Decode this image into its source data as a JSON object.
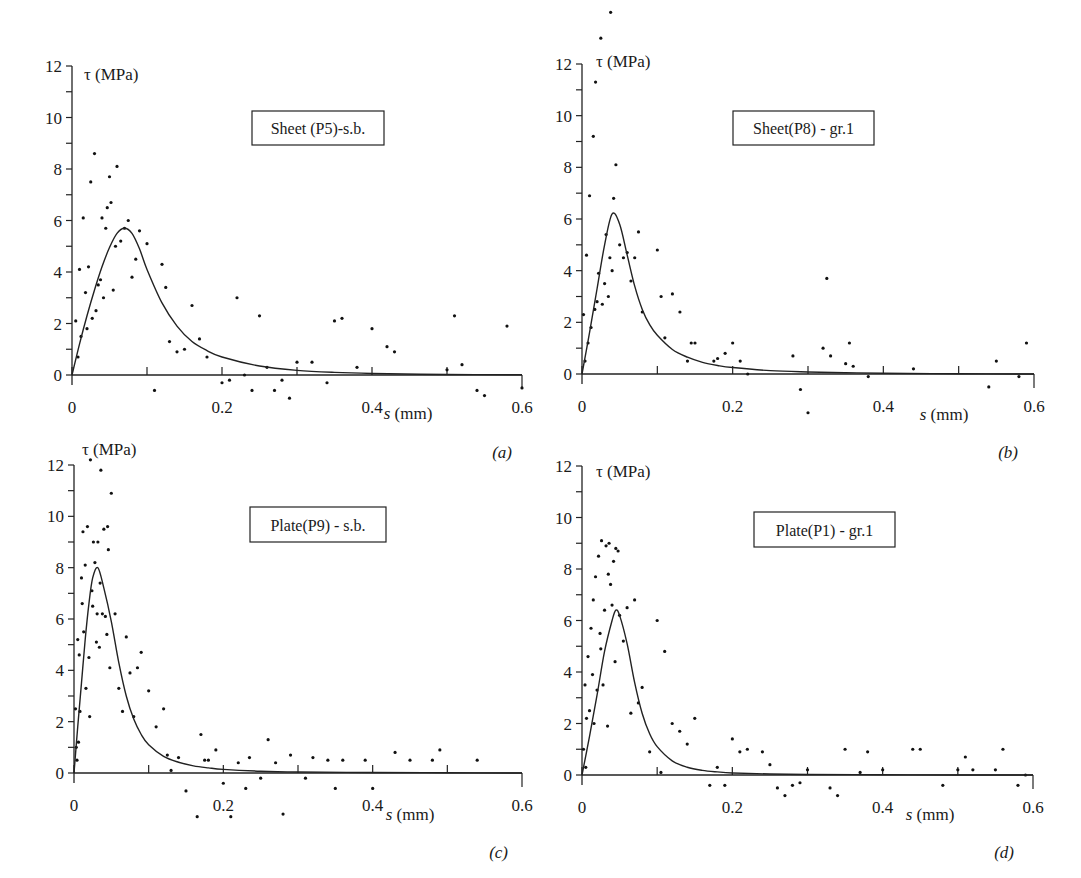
{
  "figure": {
    "panel_tags": [
      "(a)",
      "(b)",
      "(c)",
      "(d)"
    ]
  },
  "chart_data": [
    {
      "type": "scatter",
      "panel": "(a)",
      "title": "Sheet (P5)-s.b.",
      "xlabel": "s (mm)",
      "ylabel": "τ (MPa)",
      "xlim": [
        0,
        0.6
      ],
      "ylim": [
        0,
        12
      ],
      "xticks": [
        "0",
        "0.2",
        "0.4",
        "0.6"
      ],
      "yticks": [
        "0",
        "2",
        "4",
        "6",
        "8",
        "10",
        "12"
      ],
      "grid": false,
      "legend_position": "upper-center (boxed label)",
      "fit_curve": {
        "name": "bond-slip fit",
        "peak_s": 0.07,
        "peak_tau": 5.7,
        "x": [
          0,
          0.01,
          0.02,
          0.03,
          0.04,
          0.05,
          0.06,
          0.07,
          0.08,
          0.09,
          0.1,
          0.12,
          0.14,
          0.16,
          0.18,
          0.2,
          0.25,
          0.3,
          0.35,
          0.4,
          0.5,
          0.6
        ],
        "y": [
          0,
          1.2,
          2.3,
          3.3,
          4.2,
          4.95,
          5.5,
          5.7,
          5.5,
          4.9,
          4.1,
          2.8,
          1.9,
          1.3,
          0.95,
          0.7,
          0.35,
          0.18,
          0.1,
          0.06,
          0.02,
          0.01
        ]
      },
      "points": {
        "x": [
          0.005,
          0.008,
          0.01,
          0.012,
          0.015,
          0.018,
          0.02,
          0.022,
          0.025,
          0.027,
          0.03,
          0.032,
          0.035,
          0.038,
          0.04,
          0.042,
          0.045,
          0.047,
          0.05,
          0.052,
          0.055,
          0.058,
          0.06,
          0.065,
          0.07,
          0.075,
          0.08,
          0.085,
          0.09,
          0.1,
          0.11,
          0.12,
          0.125,
          0.13,
          0.14,
          0.15,
          0.16,
          0.17,
          0.18,
          0.2,
          0.21,
          0.22,
          0.23,
          0.24,
          0.25,
          0.26,
          0.27,
          0.28,
          0.29,
          0.3,
          0.32,
          0.34,
          0.35,
          0.36,
          0.38,
          0.4,
          0.42,
          0.43,
          0.5,
          0.51,
          0.52,
          0.54,
          0.55,
          0.58,
          0.6
        ],
        "y": [
          2.1,
          0.7,
          4.1,
          1.5,
          6.1,
          3.2,
          1.8,
          4.2,
          7.5,
          2.2,
          8.6,
          2.5,
          3.5,
          3.7,
          6.1,
          3.0,
          5.7,
          6.5,
          7.7,
          6.7,
          3.3,
          5.0,
          8.1,
          5.2,
          5.7,
          6.0,
          3.8,
          4.5,
          5.6,
          5.1,
          -0.6,
          4.3,
          3.4,
          1.3,
          0.9,
          1.0,
          2.7,
          1.4,
          0.7,
          -0.3,
          -0.2,
          3.0,
          0.0,
          -0.6,
          2.3,
          0.3,
          -0.6,
          -0.2,
          -0.9,
          0.5,
          0.5,
          -0.3,
          2.1,
          2.2,
          0.3,
          1.8,
          1.1,
          0.9,
          0.2,
          2.3,
          0.4,
          -0.6,
          -0.8,
          1.9,
          -0.5
        ]
      }
    },
    {
      "type": "scatter",
      "panel": "(b)",
      "title": "Sheet(P8) - gr.1",
      "xlabel": "s (mm)",
      "ylabel": "τ (MPa)",
      "xlim": [
        0,
        0.6
      ],
      "ylim": [
        0,
        12
      ],
      "xticks": [
        "0",
        "0.2",
        "0.4",
        "0.6"
      ],
      "yticks": [
        "0",
        "2",
        "4",
        "6",
        "8",
        "10",
        "12"
      ],
      "grid": false,
      "legend_position": "upper-center (boxed label)",
      "fit_curve": {
        "name": "bond-slip fit",
        "peak_s": 0.04,
        "peak_tau": 6.2,
        "x": [
          0,
          0.01,
          0.02,
          0.03,
          0.04,
          0.05,
          0.06,
          0.07,
          0.08,
          0.09,
          0.1,
          0.12,
          0.14,
          0.16,
          0.18,
          0.2,
          0.25,
          0.3,
          0.35,
          0.4,
          0.5,
          0.6
        ],
        "y": [
          0,
          1.6,
          3.3,
          5.0,
          6.2,
          5.8,
          4.6,
          3.4,
          2.5,
          1.9,
          1.5,
          0.95,
          0.65,
          0.45,
          0.33,
          0.25,
          0.13,
          0.08,
          0.05,
          0.03,
          0.01,
          0.0
        ]
      },
      "points": {
        "x": [
          0.002,
          0.004,
          0.006,
          0.008,
          0.01,
          0.012,
          0.015,
          0.017,
          0.018,
          0.02,
          0.022,
          0.025,
          0.027,
          0.03,
          0.032,
          0.035,
          0.037,
          0.038,
          0.04,
          0.042,
          0.045,
          0.05,
          0.055,
          0.06,
          0.065,
          0.07,
          0.075,
          0.08,
          0.1,
          0.105,
          0.11,
          0.12,
          0.13,
          0.14,
          0.145,
          0.15,
          0.175,
          0.18,
          0.19,
          0.2,
          0.21,
          0.22,
          0.28,
          0.29,
          0.3,
          0.32,
          0.325,
          0.33,
          0.35,
          0.355,
          0.36,
          0.38,
          0.44,
          0.54,
          0.55,
          0.58,
          0.59
        ],
        "y": [
          2.3,
          0.5,
          4.6,
          1.2,
          6.9,
          1.8,
          9.2,
          2.5,
          11.3,
          2.8,
          3.9,
          13.0,
          2.7,
          3.5,
          5.4,
          3.0,
          4.5,
          14.0,
          4.0,
          6.8,
          8.1,
          5.0,
          4.5,
          4.7,
          3.6,
          4.5,
          5.5,
          2.4,
          4.8,
          3.0,
          1.4,
          3.1,
          2.4,
          0.5,
          1.2,
          1.2,
          0.5,
          0.6,
          0.8,
          1.2,
          0.5,
          0.0,
          0.7,
          -0.6,
          -1.5,
          1.0,
          3.7,
          0.7,
          0.4,
          1.2,
          0.3,
          -0.1,
          0.2,
          -0.5,
          0.5,
          -0.1,
          1.2
        ]
      }
    },
    {
      "type": "scatter",
      "panel": "(c)",
      "title": "Plate(P9) - s.b.",
      "xlabel": "s (mm)",
      "ylabel": "τ (MPa)",
      "xlim": [
        0,
        0.6
      ],
      "ylim": [
        0,
        12
      ],
      "xticks": [
        "0",
        "0.2",
        "0.4",
        "0.6"
      ],
      "yticks": [
        "0",
        "2",
        "4",
        "6",
        "8",
        "10",
        "12"
      ],
      "grid": false,
      "legend_position": "upper-center (boxed label)",
      "fit_curve": {
        "name": "bond-slip fit",
        "peak_s": 0.032,
        "peak_tau": 8.0,
        "x": [
          0,
          0.005,
          0.01,
          0.015,
          0.02,
          0.025,
          0.032,
          0.04,
          0.05,
          0.06,
          0.07,
          0.08,
          0.09,
          0.1,
          0.12,
          0.14,
          0.16,
          0.18,
          0.2,
          0.25,
          0.3,
          0.4,
          0.5,
          0.6
        ],
        "y": [
          0,
          1.8,
          3.5,
          5.2,
          6.6,
          7.6,
          8.0,
          7.2,
          5.9,
          4.3,
          3.0,
          2.1,
          1.5,
          1.1,
          0.65,
          0.42,
          0.28,
          0.2,
          0.14,
          0.07,
          0.04,
          0.02,
          0.01,
          0.0
        ]
      },
      "points": {
        "x": [
          0.002,
          0.003,
          0.004,
          0.005,
          0.006,
          0.007,
          0.008,
          0.01,
          0.011,
          0.012,
          0.013,
          0.015,
          0.016,
          0.018,
          0.02,
          0.021,
          0.022,
          0.024,
          0.025,
          0.026,
          0.028,
          0.03,
          0.031,
          0.032,
          0.034,
          0.035,
          0.036,
          0.038,
          0.04,
          0.042,
          0.044,
          0.045,
          0.046,
          0.048,
          0.05,
          0.055,
          0.06,
          0.065,
          0.07,
          0.075,
          0.08,
          0.085,
          0.09,
          0.1,
          0.11,
          0.12,
          0.125,
          0.13,
          0.14,
          0.15,
          0.165,
          0.17,
          0.175,
          0.18,
          0.19,
          0.2,
          0.21,
          0.22,
          0.23,
          0.235,
          0.25,
          0.26,
          0.27,
          0.28,
          0.29,
          0.31,
          0.32,
          0.34,
          0.35,
          0.36,
          0.39,
          0.4,
          0.43,
          0.45,
          0.48,
          0.49,
          0.54
        ],
        "y": [
          2.5,
          1.0,
          0.5,
          5.2,
          1.2,
          4.6,
          2.4,
          7.6,
          6.6,
          9.4,
          5.5,
          8.1,
          3.3,
          9.6,
          4.5,
          2.2,
          12.2,
          7.1,
          6.5,
          9.0,
          8.2,
          5.1,
          6.2,
          9.0,
          4.9,
          7.4,
          11.8,
          6.2,
          9.5,
          6.1,
          5.4,
          9.6,
          8.7,
          4.1,
          10.9,
          6.2,
          3.3,
          2.4,
          5.3,
          3.9,
          2.2,
          4.1,
          4.7,
          3.2,
          1.8,
          2.5,
          0.7,
          0.1,
          0.6,
          -0.7,
          -1.7,
          1.5,
          0.5,
          0.5,
          0.9,
          -0.4,
          -1.7,
          0.4,
          -0.6,
          0.6,
          -0.2,
          1.3,
          0.4,
          -1.6,
          0.7,
          -0.2,
          0.6,
          0.5,
          -0.6,
          0.5,
          0.5,
          -0.6,
          0.8,
          0.5,
          0.5,
          0.9,
          0.5
        ]
      }
    },
    {
      "type": "scatter",
      "panel": "(d)",
      "title": "Plate(P1) - gr.1",
      "xlabel": "s (mm)",
      "ylabel": "τ (MPa)",
      "xlim": [
        0,
        0.6
      ],
      "ylim": [
        0,
        12
      ],
      "xticks": [
        "0",
        "0.2",
        "0.4",
        "0.6"
      ],
      "yticks": [
        "0",
        "2",
        "4",
        "6",
        "8",
        "10",
        "12"
      ],
      "grid": false,
      "legend_position": "upper-center (boxed label)",
      "fit_curve": {
        "name": "bond-slip fit",
        "peak_s": 0.045,
        "peak_tau": 6.4,
        "x": [
          0,
          0.01,
          0.02,
          0.03,
          0.04,
          0.045,
          0.05,
          0.06,
          0.07,
          0.08,
          0.09,
          0.1,
          0.12,
          0.14,
          0.16,
          0.18,
          0.2,
          0.25,
          0.3,
          0.4,
          0.5,
          0.6
        ],
        "y": [
          0,
          1.5,
          3.1,
          4.8,
          6.0,
          6.4,
          6.2,
          5.1,
          3.6,
          2.4,
          1.6,
          1.1,
          0.55,
          0.3,
          0.18,
          0.12,
          0.08,
          0.04,
          0.02,
          0.01,
          0.0,
          0.0
        ]
      },
      "points": {
        "x": [
          0.002,
          0.004,
          0.005,
          0.006,
          0.008,
          0.01,
          0.012,
          0.014,
          0.015,
          0.016,
          0.018,
          0.02,
          0.022,
          0.024,
          0.025,
          0.026,
          0.028,
          0.03,
          0.032,
          0.034,
          0.035,
          0.036,
          0.038,
          0.04,
          0.042,
          0.044,
          0.045,
          0.048,
          0.05,
          0.055,
          0.06,
          0.065,
          0.07,
          0.075,
          0.08,
          0.09,
          0.1,
          0.105,
          0.11,
          0.12,
          0.13,
          0.14,
          0.15,
          0.17,
          0.18,
          0.19,
          0.2,
          0.21,
          0.22,
          0.24,
          0.25,
          0.26,
          0.27,
          0.28,
          0.29,
          0.3,
          0.33,
          0.34,
          0.35,
          0.37,
          0.38,
          0.4,
          0.44,
          0.45,
          0.48,
          0.5,
          0.51,
          0.52,
          0.55,
          0.56,
          0.58,
          0.59
        ],
        "y": [
          1.0,
          3.5,
          0.3,
          2.2,
          4.6,
          2.5,
          5.7,
          3.9,
          6.8,
          2.0,
          7.7,
          3.3,
          8.5,
          5.5,
          4.9,
          9.1,
          3.5,
          6.4,
          8.9,
          1.9,
          7.8,
          9.0,
          7.4,
          6.6,
          8.3,
          4.4,
          8.8,
          8.7,
          6.2,
          5.2,
          6.5,
          2.4,
          6.8,
          2.8,
          3.4,
          0.9,
          6.0,
          0.1,
          4.8,
          2.0,
          1.7,
          1.2,
          2.2,
          -0.4,
          0.3,
          -0.4,
          1.4,
          0.9,
          1.0,
          0.9,
          0.4,
          -0.5,
          -0.8,
          -0.4,
          -0.3,
          0.2,
          -0.5,
          -0.8,
          1.0,
          0.1,
          0.9,
          0.2,
          1.0,
          1.0,
          -0.4,
          0.2,
          0.7,
          0.2,
          0.2,
          1.0,
          -0.4,
          0.0
        ]
      }
    }
  ]
}
